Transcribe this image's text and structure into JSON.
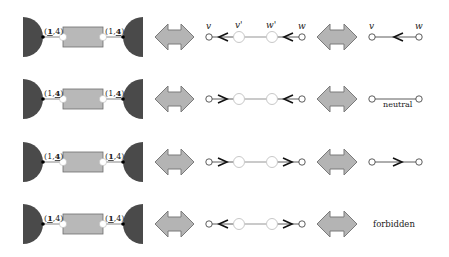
{
  "colors": {
    "half_disc": "#4a4a4a",
    "gadget_fill": "#b8b8b8",
    "gadget_stroke": "#6e6e6e",
    "double_arrow_fill": "#b4b4b4",
    "double_arrow_stroke": "#7a7a7a",
    "light_node": "#c8c8c8",
    "edge": "#333333",
    "light_edge": "#bdbdbd"
  },
  "labels": {
    "v": "v",
    "w": "w",
    "v_prime": "v'",
    "w_prime": "w'",
    "neutral": "neutral",
    "forbidden": "forbidden"
  },
  "rows": [
    {
      "y": 37,
      "left_label": {
        "open": "(",
        "a": "1",
        "sep": ",",
        "b": "4",
        "close": ")",
        "bold": "a"
      },
      "right_label": {
        "open": "(",
        "a": "1",
        "sep": ",",
        "b": "4",
        "close": ")",
        "bold": "b"
      },
      "chain_left_arrow": "left",
      "chain_right_arrow": "left",
      "show_vertex_names": true,
      "result": {
        "type": "edge",
        "direction": "left",
        "show_names": true
      }
    },
    {
      "y": 99,
      "left_label": {
        "open": "(",
        "a": "1",
        "sep": ",",
        "b": "4",
        "close": ")",
        "bold": "b"
      },
      "right_label": {
        "open": "(",
        "a": "1",
        "sep": ",",
        "b": "4",
        "close": ")",
        "bold": "b"
      },
      "chain_left_arrow": "right",
      "chain_right_arrow": "left",
      "show_vertex_names": false,
      "result": {
        "type": "neutral",
        "text": "neutral"
      }
    },
    {
      "y": 162,
      "left_label": {
        "open": "(",
        "a": "1",
        "sep": ",",
        "b": "4",
        "close": ")",
        "bold": "b"
      },
      "right_label": {
        "open": "(",
        "a": "1",
        "sep": ",",
        "b": "4",
        "close": ")",
        "bold": "a"
      },
      "chain_left_arrow": "right",
      "chain_right_arrow": "right",
      "show_vertex_names": false,
      "result": {
        "type": "edge",
        "direction": "right",
        "show_names": false
      }
    },
    {
      "y": 224,
      "left_label": {
        "open": "(",
        "a": "1",
        "sep": ",",
        "b": "4",
        "close": ")",
        "bold": "a"
      },
      "right_label": {
        "open": "(",
        "a": "1",
        "sep": ",",
        "b": "4",
        "close": ")",
        "bold": "a"
      },
      "chain_left_arrow": "left",
      "chain_right_arrow": "right",
      "show_vertex_names": false,
      "result": {
        "type": "forbidden",
        "text": "forbidden"
      }
    }
  ]
}
